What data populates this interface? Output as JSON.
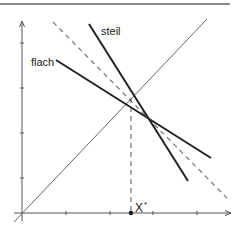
{
  "diagram": {
    "type": "economics-line-diagram",
    "labels": {
      "flat_line": "flach",
      "steep_line": "steil",
      "point": "X",
      "point_sup": "*"
    },
    "colors": {
      "line": "#222222",
      "axis": "#555555",
      "dashed": "#777777",
      "diagonal": "#666666",
      "top_rule": "#888888"
    },
    "elements": [
      "top-rule",
      "y-axis with 4 ticks",
      "x-axis with 4 ticks",
      "45-degree diagonal through origin",
      "dashed line with slope -1 through intersection",
      "flat line (flach)",
      "steep line (steil)",
      "vertical dashed drop line to x-axis",
      "point X* on x-axis"
    ]
  }
}
